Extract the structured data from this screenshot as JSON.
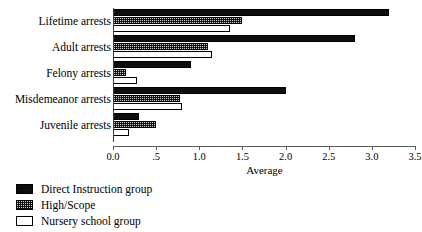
{
  "chart_data": {
    "type": "bar",
    "orientation": "horizontal",
    "title": "",
    "xlabel": "Average",
    "ylabel": "",
    "xlim": [
      0.0,
      3.5
    ],
    "grid": false,
    "legend_position": "bottom-left",
    "categories": [
      "Lifetime arrests",
      "Adult arrests",
      "Felony arrests",
      "Misdemeanor arrests",
      "Juvenile arrests"
    ],
    "tick_labels": [
      "0.0",
      ".5",
      "1.0",
      "1.5",
      "2.0",
      "2.5",
      "3.0",
      "3.5"
    ],
    "tick_values": [
      0.0,
      0.5,
      1.0,
      1.5,
      2.0,
      2.5,
      3.0,
      3.5
    ],
    "series": [
      {
        "name": "Direct Instruction group",
        "fill": "solid-black",
        "color": "#0d0d0d",
        "values": [
          3.2,
          2.8,
          0.9,
          2.0,
          0.3
        ]
      },
      {
        "name": "High/Scope",
        "fill": "dotted-gray",
        "color": "#c9c9c9",
        "values": [
          1.5,
          1.1,
          0.15,
          0.78,
          0.5
        ]
      },
      {
        "name": "Nursery school group",
        "fill": "white",
        "color": "#ffffff",
        "values": [
          1.35,
          1.15,
          0.28,
          0.8,
          0.19
        ]
      }
    ]
  },
  "legend": {
    "items": [
      {
        "label": "Direct Instruction group",
        "swatch": "solid-black-swatch"
      },
      {
        "label": "High/Scope",
        "swatch": "dotted-gray-swatch"
      },
      {
        "label": "Nursery school group",
        "swatch": "white-swatch"
      }
    ]
  },
  "axis": {
    "x_title": "Average"
  }
}
